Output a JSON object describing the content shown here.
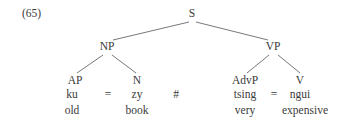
{
  "figure": {
    "example_number": "(65)",
    "background_color": "#ffffff",
    "ink_color": "#3a3a3a"
  },
  "tree": {
    "root": {
      "label": "S"
    },
    "nodes": [
      {
        "id": "s",
        "label": "S"
      },
      {
        "id": "np",
        "label": "NP"
      },
      {
        "id": "vp",
        "label": "VP"
      },
      {
        "id": "ap",
        "label": "AP"
      },
      {
        "id": "n",
        "label": "N"
      },
      {
        "id": "advp",
        "label": "AdvP"
      },
      {
        "id": "v",
        "label": "V"
      }
    ],
    "edges": [
      {
        "from": "s",
        "to": "np"
      },
      {
        "from": "s",
        "to": "vp"
      },
      {
        "from": "np",
        "to": "ap"
      },
      {
        "from": "np",
        "to": "n"
      },
      {
        "from": "vp",
        "to": "advp"
      },
      {
        "from": "vp",
        "to": "v"
      }
    ]
  },
  "leaves": [
    {
      "node": "AP",
      "form": "ku",
      "gloss": "old"
    },
    {
      "node": "N",
      "form": "zy",
      "gloss": "book"
    },
    {
      "node": "AdvP",
      "form": "tsing",
      "gloss": "very"
    },
    {
      "node": "V",
      "form": "ngui",
      "gloss": "expensive"
    }
  ],
  "markers": {
    "clitic_left": "=",
    "word_boundary": "#",
    "clitic_right": "="
  }
}
